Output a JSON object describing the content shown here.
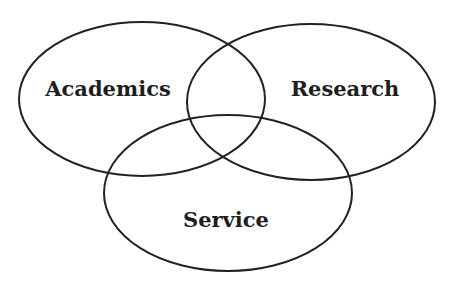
{
  "diagram": {
    "type": "venn",
    "stroke_color": "#222222",
    "background": "#ffffff",
    "sets": [
      {
        "label": "Academics",
        "cx": 142,
        "cy": 99,
        "rx": 123,
        "ry": 77,
        "label_x": 108,
        "label_y": 96
      },
      {
        "label": "Research",
        "cx": 311,
        "cy": 102,
        "rx": 124,
        "ry": 78,
        "label_x": 345,
        "label_y": 96
      },
      {
        "label": "Service",
        "cx": 228,
        "cy": 193,
        "rx": 124,
        "ry": 78,
        "label_x": 226,
        "label_y": 227
      }
    ]
  }
}
